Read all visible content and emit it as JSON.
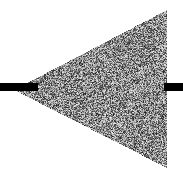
{
  "figure": {
    "canvas": {
      "width": 183,
      "height": 179,
      "background_color": "#ffffff"
    },
    "shapes": [
      {
        "name": "noise-triangle",
        "type": "triangle",
        "direction": "left",
        "fill_style": "random-grayscale-noise",
        "vertices": [
          {
            "x": 14,
            "y": 90
          },
          {
            "x": 167,
            "y": 10
          },
          {
            "x": 167,
            "y": 168
          }
        ],
        "noise": {
          "grain_size_px": 1,
          "min_gray": 20,
          "max_gray": 245,
          "mean_gray": 140,
          "mean_color": "#8c8c8c",
          "seed": 20240517
        },
        "edge_color": "#000000"
      },
      {
        "name": "left-bar",
        "type": "rectangle",
        "color": "#000000",
        "x": 0,
        "y": 83,
        "width": 38,
        "height": 8
      },
      {
        "name": "right-bar",
        "type": "rectangle",
        "color": "#000000",
        "x": 164,
        "y": 83,
        "width": 19,
        "height": 8
      }
    ]
  }
}
